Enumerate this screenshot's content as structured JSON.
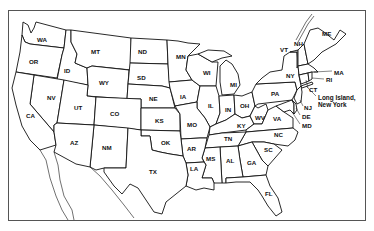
{
  "map": {
    "type": "outline map",
    "subject": "United States (contiguous)",
    "frame_color": "#555555",
    "line_color": "#111111",
    "fill_color": "#ffffff",
    "states": [
      {
        "abbr": "WA",
        "x": 43,
        "y": 40
      },
      {
        "abbr": "OR",
        "x": 35,
        "y": 62
      },
      {
        "abbr": "ID",
        "x": 67,
        "y": 71
      },
      {
        "abbr": "MT",
        "x": 97,
        "y": 52
      },
      {
        "abbr": "WY",
        "x": 105,
        "y": 83
      },
      {
        "abbr": "ND",
        "x": 144,
        "y": 52
      },
      {
        "abbr": "SD",
        "x": 143,
        "y": 78
      },
      {
        "abbr": "NE",
        "x": 149,
        "y": 99
      },
      {
        "abbr": "MN",
        "x": 178,
        "y": 57
      },
      {
        "abbr": "IA",
        "x": 181,
        "y": 97
      },
      {
        "abbr": "WI",
        "x": 207,
        "y": 73
      },
      {
        "abbr": "MI",
        "x": 231,
        "y": 85
      },
      {
        "abbr": "IL",
        "x": 209,
        "y": 106
      },
      {
        "abbr": "IN",
        "x": 227,
        "y": 110
      },
      {
        "abbr": "OH",
        "x": 245,
        "y": 107
      },
      {
        "abbr": "NV",
        "x": 49,
        "y": 98
      },
      {
        "abbr": "UT",
        "x": 77,
        "y": 108
      },
      {
        "abbr": "CO",
        "x": 115,
        "y": 114
      },
      {
        "abbr": "KS",
        "x": 158,
        "y": 121
      },
      {
        "abbr": "MO",
        "x": 190,
        "y": 125
      },
      {
        "abbr": "KY",
        "x": 241,
        "y": 124
      },
      {
        "abbr": "WV",
        "x": 259,
        "y": 118
      },
      {
        "abbr": "VA",
        "x": 277,
        "y": 119
      },
      {
        "abbr": "CA",
        "x": 31,
        "y": 116
      },
      {
        "abbr": "AZ",
        "x": 74,
        "y": 143
      },
      {
        "abbr": "NM",
        "x": 107,
        "y": 148
      },
      {
        "abbr": "OK",
        "x": 165,
        "y": 143
      },
      {
        "abbr": "AR",
        "x": 191,
        "y": 149
      },
      {
        "abbr": "TN",
        "x": 228,
        "y": 139
      },
      {
        "abbr": "NC",
        "x": 278,
        "y": 135
      },
      {
        "abbr": "SC",
        "x": 268,
        "y": 150
      },
      {
        "abbr": "MS",
        "x": 209,
        "y": 159
      },
      {
        "abbr": "AL",
        "x": 229,
        "y": 161
      },
      {
        "abbr": "GA",
        "x": 250,
        "y": 163
      },
      {
        "abbr": "LA",
        "x": 193,
        "y": 169
      },
      {
        "abbr": "TX",
        "x": 153,
        "y": 172
      },
      {
        "abbr": "FL",
        "x": 268,
        "y": 194
      },
      {
        "abbr": "PA",
        "x": 274,
        "y": 94
      },
      {
        "abbr": "NY",
        "x": 290,
        "y": 76
      },
      {
        "abbr": "VT",
        "x": 284,
        "y": 50
      },
      {
        "abbr": "NH",
        "x": 297,
        "y": 44
      },
      {
        "abbr": "ME",
        "x": 323,
        "y": 34
      }
    ],
    "callouts": [
      {
        "abbr": "MA",
        "x": 334,
        "y": 73
      },
      {
        "abbr": "RI",
        "x": 326,
        "y": 81
      },
      {
        "abbr": "CT",
        "x": 309,
        "y": 90
      },
      {
        "abbr": "NJ",
        "x": 304,
        "y": 108
      },
      {
        "abbr": "DE",
        "x": 302,
        "y": 117
      },
      {
        "abbr": "MD",
        "x": 302,
        "y": 126
      }
    ],
    "annotation": {
      "line1": "Long Island,",
      "line2": "New York",
      "x": 318,
      "y": 98
    }
  }
}
